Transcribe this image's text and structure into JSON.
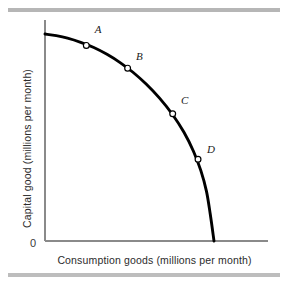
{
  "figure": {
    "background": "#ffffff",
    "rule_color": "#b6b6b6",
    "axis_color": "#8a8a8a",
    "curve_color": "#000000",
    "marker_fill": "#ffffff",
    "marker_stroke": "#000000"
  },
  "axes": {
    "origin_label": "0",
    "x_label": "Consumption goods (millions per month)",
    "y_label": "Capital good (millions per month)"
  },
  "chart_data": {
    "type": "line",
    "title": "",
    "xlabel": "Consumption goods (millions per month)",
    "ylabel": "Capital good (millions per month)",
    "xlim": [
      0,
      10
    ],
    "ylim": [
      0,
      10
    ],
    "grid": false,
    "legend": null,
    "curve_name": "Production possibilities frontier",
    "curve_shape": "concave-to-origin",
    "series": [
      {
        "name": "PPF",
        "x": [
          0.0,
          0.6,
          1.2,
          1.9,
          2.6,
          3.3,
          4.0,
          4.7,
          5.4,
          6.1,
          6.8,
          7.4,
          7.9,
          8.3,
          8.6,
          8.8,
          9.0
        ],
        "y": [
          10.0,
          9.92,
          9.8,
          9.6,
          9.35,
          9.02,
          8.62,
          8.14,
          7.57,
          6.9,
          6.1,
          5.25,
          4.35,
          3.4,
          2.4,
          1.3,
          0.0
        ]
      }
    ],
    "points": [
      {
        "label": "A",
        "x": 2.2,
        "y": 9.45,
        "label_dx": 0.55,
        "label_dy": 0.7
      },
      {
        "label": "B",
        "x": 4.4,
        "y": 8.35,
        "label_dx": 0.55,
        "label_dy": 0.5
      },
      {
        "label": "C",
        "x": 6.8,
        "y": 6.15,
        "label_dx": 0.55,
        "label_dy": 0.55
      },
      {
        "label": "D",
        "x": 8.15,
        "y": 3.95,
        "label_dx": 0.58,
        "label_dy": 0.4
      }
    ],
    "axis_ticks": {
      "x": [],
      "y": []
    }
  }
}
